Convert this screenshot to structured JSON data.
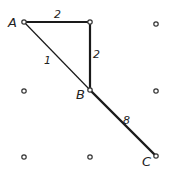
{
  "diagram": {
    "type": "grid-graph",
    "grid": {
      "columns_x": [
        24,
        90,
        156
      ],
      "rows_y": [
        22,
        90,
        156
      ]
    },
    "nodes": [
      {
        "id": "A",
        "label": "A",
        "x": 24,
        "y": 22
      },
      {
        "id": "n01",
        "label": "",
        "x": 90,
        "y": 22
      },
      {
        "id": "n02",
        "label": "",
        "x": 156,
        "y": 24
      },
      {
        "id": "n10",
        "label": "",
        "x": 24,
        "y": 91
      },
      {
        "id": "B",
        "label": "B",
        "x": 90,
        "y": 90
      },
      {
        "id": "n12",
        "label": "",
        "x": 156,
        "y": 91
      },
      {
        "id": "n20",
        "label": "",
        "x": 24,
        "y": 157
      },
      {
        "id": "n21",
        "label": "",
        "x": 90,
        "y": 157
      },
      {
        "id": "C",
        "label": "C",
        "x": 156,
        "y": 156
      }
    ],
    "edges": [
      {
        "from": "A",
        "to": "n01",
        "weight": "2",
        "thick": true
      },
      {
        "from": "n01",
        "to": "B",
        "weight": "2",
        "thick": true
      },
      {
        "from": "A",
        "to": "B",
        "weight": "1",
        "thick": false
      },
      {
        "from": "B",
        "to": "C",
        "weight": "8",
        "thick": true
      }
    ],
    "labels": {
      "node_A": "A",
      "node_B": "B",
      "node_C": "C",
      "edge_A_top": "2",
      "edge_top_B": "2",
      "edge_A_B": "1",
      "edge_B_C": "8"
    },
    "colors": {
      "line": "#1a1a1a",
      "node_stroke": "#333333",
      "background": "#ffffff"
    }
  }
}
